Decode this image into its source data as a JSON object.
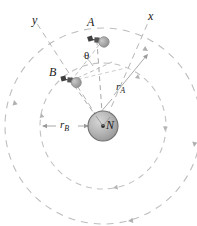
{
  "figure": {
    "colors": {
      "orbit_dash": "#bdbdbd",
      "axis_dash": "#b5b5b5",
      "body_fill": "#b3b3b3",
      "body_stroke": "#6e6e6e",
      "label_text": "#1a1a1a",
      "background": "#ffffff"
    },
    "labels": {
      "axis_x": "x",
      "axis_y": "y",
      "craft_a": "A",
      "craft_b": "B",
      "central_body": "N",
      "angle": "θ",
      "radius_a_main": "r",
      "radius_a_sub": "A",
      "radius_b_main": "r",
      "radius_b_sub": "B"
    },
    "geometry": {
      "center": [
        103,
        126
      ],
      "central_body_radius": 15,
      "orbit_a_radius": 98,
      "orbit_b_radius": 63,
      "craft_a_position": [
        97,
        40
      ],
      "craft_b_position": [
        70,
        80
      ],
      "axis_x_end": [
        146,
        22
      ],
      "axis_y_end": [
        40,
        26
      ]
    },
    "icons": {
      "craft": "spacecraft-icon",
      "center_dot": "center-dot-icon",
      "orbit_arrow": "orbit-direction-arrowhead",
      "radius_arrow": "radius-arrowhead"
    }
  }
}
